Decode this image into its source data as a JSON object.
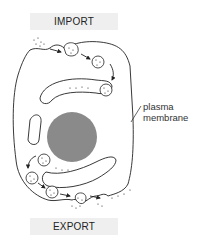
{
  "diagram": {
    "title_top": "IMPORT",
    "title_bottom": "EXPORT",
    "labels": {
      "membrane_line1": "plasma",
      "membrane_line2": "membrane"
    },
    "colors": {
      "nucleus": "#8a8a8a",
      "stroke": "#222222",
      "banner_bg": "#efefef"
    },
    "components": [
      "plasma-membrane",
      "nucleus",
      "endomembrane-compartments",
      "import-vesicles",
      "export-vesicles"
    ]
  }
}
